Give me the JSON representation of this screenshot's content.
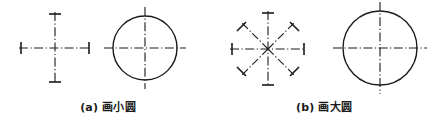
{
  "figure": {
    "background_color": "#ffffff",
    "ink_color": "#1a1a1a",
    "panels": [
      {
        "id": "a",
        "caption_label": "(a)",
        "caption_text": "画小圆",
        "caption_full": "(a) 画小圆",
        "construction": {
          "name": "crosshair-centerline",
          "type": "cross",
          "ray_count": 4,
          "center": {
            "x": 55,
            "y": 48
          },
          "ray_length": 36,
          "tick_half_length": 6,
          "ray_angles_deg": [
            0,
            90,
            180,
            270
          ],
          "line_style": "dash-dot",
          "line_width": 1.1
        },
        "result": {
          "name": "small-circle",
          "type": "circle",
          "center": {
            "x": 145,
            "y": 48
          },
          "radius": 32,
          "line_width": 1.4,
          "centerline_overhang": 9,
          "centerline_style": "dash-dot"
        }
      },
      {
        "id": "b",
        "caption_label": "(b)",
        "caption_text": "画大圆",
        "caption_full": "(b) 画大圆",
        "construction": {
          "name": "eight-ray-star-centerline",
          "type": "star",
          "ray_count": 8,
          "center": {
            "x": 52,
            "y": 49
          },
          "ray_length": 38,
          "tick_half_length": 6,
          "ray_angles_deg": [
            0,
            45,
            90,
            135,
            180,
            225,
            270,
            315
          ],
          "line_style": "dash-dot",
          "line_width": 1.1
        },
        "result": {
          "name": "large-circle",
          "type": "circle",
          "center": {
            "x": 164,
            "y": 48
          },
          "radius": 37,
          "line_width": 1.4,
          "centerline_overhang": 10,
          "centerline_style": "dash-dot"
        }
      }
    ]
  }
}
